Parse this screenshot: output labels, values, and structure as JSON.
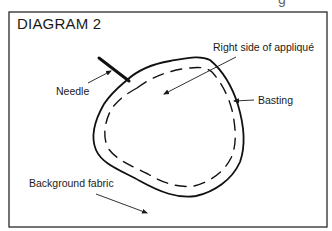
{
  "diagram": {
    "title": "DIAGRAM 2",
    "cutoff_glyph": "g",
    "labels": {
      "needle": "Needle",
      "right_side": "Right side of appliqué",
      "basting": "Basting",
      "background": "Background fabric"
    },
    "colors": {
      "ink": "#1a1a1a",
      "paper": "#ffffff"
    },
    "elements": [
      {
        "name": "frame",
        "type": "rectangle"
      },
      {
        "name": "applique-shape",
        "type": "closed-curve outline"
      },
      {
        "name": "basting-stitches",
        "type": "dashed inner curve"
      },
      {
        "name": "needle",
        "type": "thick line"
      },
      {
        "name": "arrows",
        "count": 4
      }
    ]
  }
}
